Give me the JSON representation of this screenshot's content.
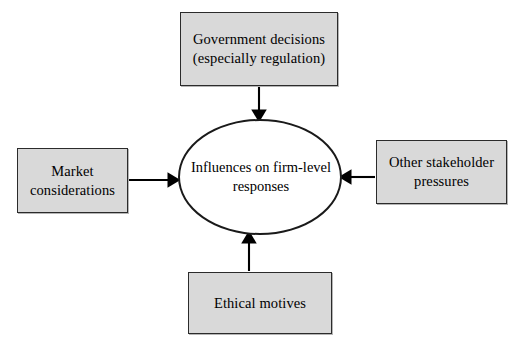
{
  "diagram": {
    "type": "hub-and-spoke",
    "center": {
      "label": "Influences on firm-level responses",
      "shape": "ellipse",
      "fill": "#ffffff",
      "stroke": "#1a1a1a"
    },
    "nodes": [
      {
        "id": "government",
        "label": "Government decisions (especially regulation)",
        "position": "top",
        "shape": "rectangle",
        "fill": "#d9d9d9",
        "stroke": "#2b2b2b"
      },
      {
        "id": "market",
        "label": "Market considerations",
        "position": "left",
        "shape": "rectangle",
        "fill": "#d9d9d9",
        "stroke": "#2b2b2b"
      },
      {
        "id": "stakeholder",
        "label": "Other stakeholder pressures",
        "position": "right",
        "shape": "rectangle",
        "fill": "#d9d9d9",
        "stroke": "#2b2b2b"
      },
      {
        "id": "ethical",
        "label": "Ethical motives",
        "position": "bottom",
        "shape": "rectangle",
        "fill": "#d9d9d9",
        "stroke": "#2b2b2b"
      }
    ],
    "edges": [
      {
        "id": "government-to-center",
        "from": "government",
        "to": "center",
        "direction": "down",
        "arrowhead": "filled-triangle"
      },
      {
        "id": "market-to-center",
        "from": "market",
        "to": "center",
        "direction": "right",
        "arrowhead": "filled-triangle"
      },
      {
        "id": "stakeholder-to-center",
        "from": "stakeholder",
        "to": "center",
        "direction": "left",
        "arrowhead": "filled-triangle"
      },
      {
        "id": "ethical-to-center",
        "from": "ethical",
        "to": "center",
        "direction": "up",
        "arrowhead": "filled-triangle"
      }
    ],
    "edge_color": "#000000"
  }
}
